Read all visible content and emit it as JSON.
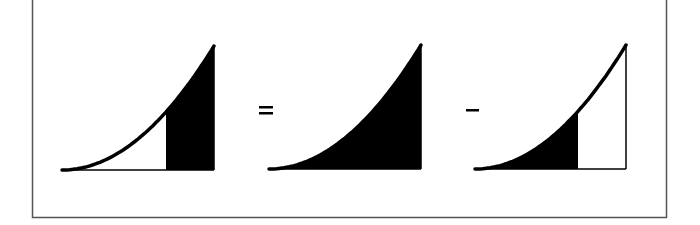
{
  "diagram": {
    "colors": {
      "fill": "#000000",
      "stroke": "#000000",
      "frame": "#555555",
      "background": "#ffffff"
    },
    "operators": {
      "equals": "=",
      "minus": "−"
    },
    "panels": [
      {
        "name": "strip-area",
        "shaded": "right-strip",
        "x0": 62,
        "x1": 214,
        "split": 166,
        "baseline": 170,
        "top": 46
      },
      {
        "name": "full-area",
        "shaded": "full",
        "x0": 269,
        "x1": 421,
        "split": 421,
        "baseline": 169,
        "top": 45
      },
      {
        "name": "left-area",
        "shaded": "left",
        "x0": 475,
        "x1": 626,
        "split": 578,
        "baseline": 169,
        "top": 45
      }
    ]
  }
}
